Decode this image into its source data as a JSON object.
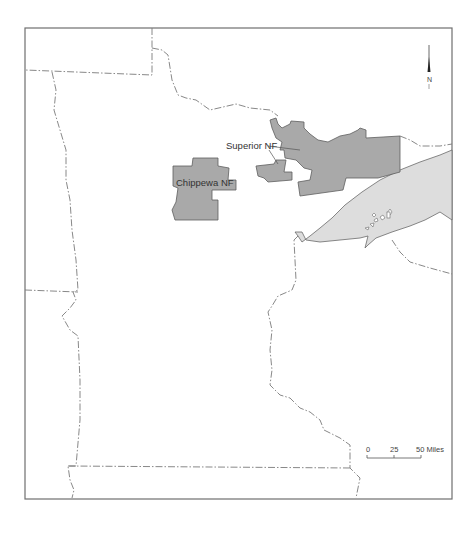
{
  "map": {
    "labels": {
      "superior": "Superior  NF",
      "chippewa": "Chippewa NF"
    },
    "north_arrow": {
      "label": "N"
    },
    "scale_bar": {
      "ticks": [
        "0",
        "25",
        "50 Miles"
      ]
    },
    "colors": {
      "forest_fill": "#a9a9a9",
      "lake_fill": "#dddddd",
      "frame": "#6f6f6f",
      "boundary": "#7a7a7a"
    }
  }
}
